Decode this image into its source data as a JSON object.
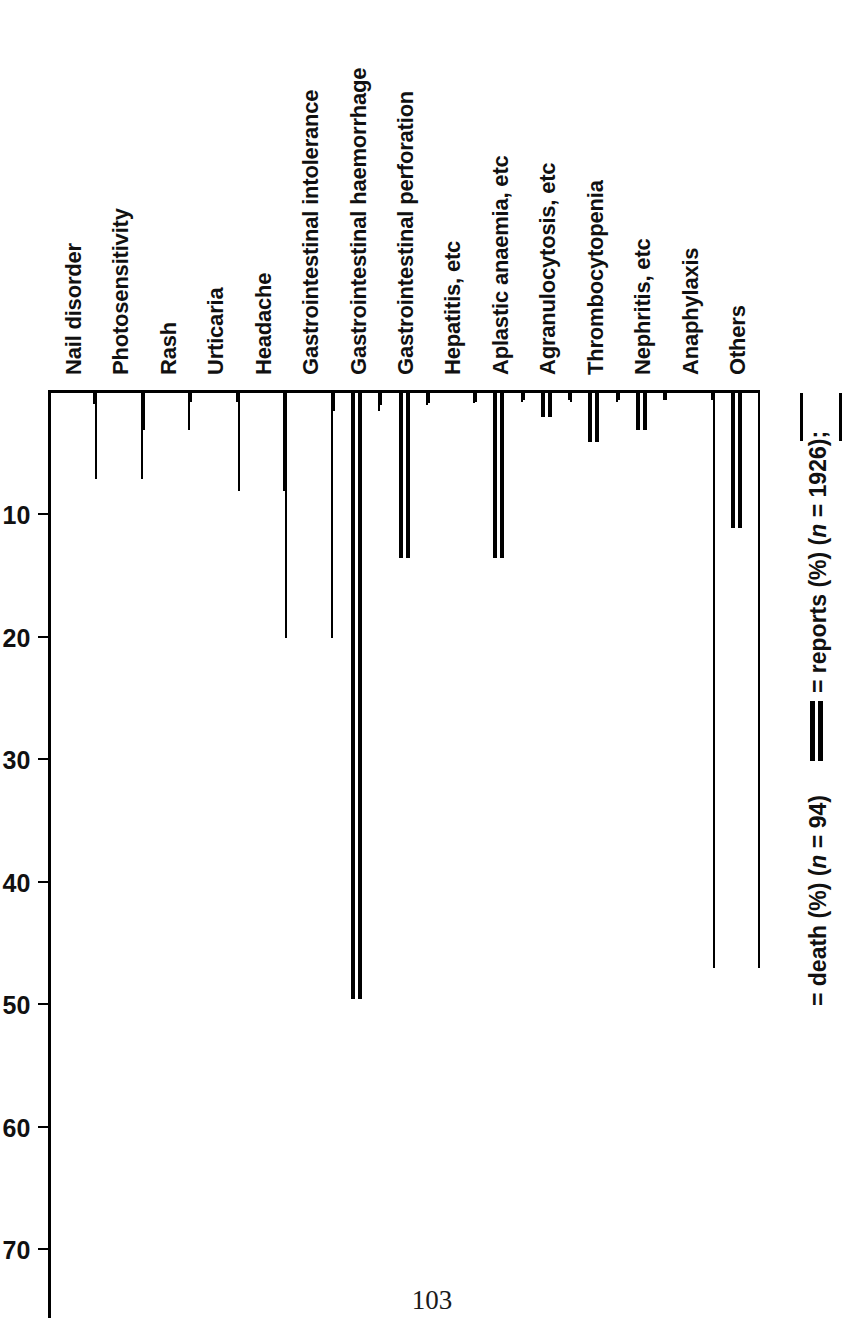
{
  "page": {
    "number": "103"
  },
  "chart_data": {
    "type": "bar",
    "title": "",
    "subtitle": "",
    "xlabel": "",
    "ylabel": "",
    "ylim": [
      0,
      75
    ],
    "yticks": [
      10,
      20,
      30,
      40,
      50,
      60,
      70
    ],
    "ytick_labels": [
      "10",
      "20",
      "30",
      "40",
      "50",
      "60",
      "70"
    ],
    "grid": false,
    "orientation": "vertical-rotated-90",
    "legend_position": "bottom-right",
    "categories": [
      "Nail disorder",
      "Photosensitivity",
      "Rash",
      "Urticaria",
      "Headache",
      "Gastrointestinal intolerance",
      "Gastrointestinal haemorrhage",
      "Gastrointestinal perforation",
      "Hepatitis, etc",
      "Aplastic anaemia, etc",
      "Agranulocytosis, etc",
      "Thrombocytopenia",
      "Nephritis, etc",
      "Anaphylaxis",
      "Others"
    ],
    "series": [
      {
        "name": "reports (%)",
        "n": 1926,
        "marker": "open-rectangle",
        "values": [
          0.9,
          7.0,
          3.0,
          0.7,
          8.0,
          20.0,
          1.5,
          1.0,
          0.8,
          0.7,
          0.6,
          0.7,
          0.6,
          0.6,
          47.0
        ]
      },
      {
        "name": "death (%)",
        "n": 94,
        "marker": "double-solid-line",
        "values": [
          0,
          0,
          0,
          0,
          0,
          0,
          49.5,
          13.5,
          0,
          13.5,
          2.0,
          4.0,
          3.0,
          0,
          11.0
        ]
      }
    ]
  },
  "legend": {
    "items": [
      {
        "swatch": "open-rectangle",
        "label_prefix": "= reports (%) (",
        "label_italic": "n",
        "label_suffix": " = 1926);"
      },
      {
        "swatch": "double-solid-line",
        "label_prefix": "= death (%) (",
        "label_italic": "n",
        "label_suffix": " = 94)"
      }
    ],
    "full_text": "= reports (%) (n = 1926);   = death (%) (n = 94)"
  }
}
